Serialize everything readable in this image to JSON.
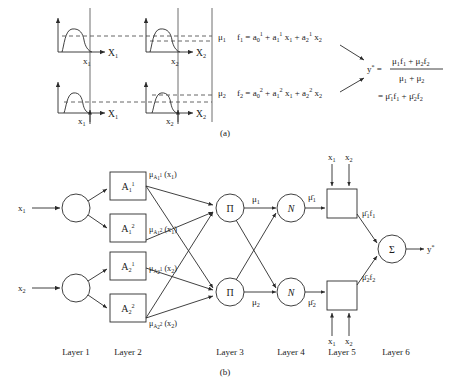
{
  "figure": {
    "caption_a": "(a)",
    "caption_b": "(b)"
  },
  "panel_a": {
    "plots": [
      {
        "id": "top-left",
        "axis_label": "X",
        "axis_sub": "1",
        "point_label": "x",
        "point_sub": "1",
        "mu_level": "high"
      },
      {
        "id": "top-right",
        "axis_label": "X",
        "axis_sub": "2",
        "point_label": "x",
        "point_sub": "2",
        "mu_level": "high"
      },
      {
        "id": "bottom-left",
        "axis_label": "X",
        "axis_sub": "1",
        "point_label": "x",
        "point_sub": "1",
        "mu_level": "low"
      },
      {
        "id": "bottom-right",
        "axis_label": "X",
        "axis_sub": "2",
        "point_label": "x",
        "point_sub": "2",
        "mu_level": "low"
      }
    ],
    "rules": [
      {
        "mu_symbol": "μ",
        "mu_sub": "1",
        "f_symbol": "f",
        "f_sub": "1",
        "equals": "=",
        "term0_base": "a",
        "term0_sub": "0",
        "term0_sup": "1",
        "plus1": "+",
        "term1_base": "a",
        "term1_sub": "1",
        "term1_sup": "1",
        "term1_var": "x",
        "term1_var_sub": "1",
        "plus2": "+",
        "term2_base": "a",
        "term2_sub": "2",
        "term2_sup": "1",
        "term2_var": "x",
        "term2_var_sub": "2"
      },
      {
        "mu_symbol": "μ",
        "mu_sub": "2",
        "f_symbol": "f",
        "f_sub": "2",
        "equals": "=",
        "term0_base": "a",
        "term0_sub": "0",
        "term0_sup": "2",
        "plus1": "+",
        "term1_base": "a",
        "term1_sub": "1",
        "term1_sup": "2",
        "term1_var": "x",
        "term1_var_sub": "1",
        "plus2": "+",
        "term2_base": "a",
        "term2_sub": "2",
        "term2_sup": "2",
        "term2_var": "x",
        "term2_var_sub": "2"
      }
    ],
    "output": {
      "y_symbol": "y",
      "y_sup": "*",
      "equals": "=",
      "numerator": {
        "m1": "μ",
        "m1s": "1",
        "f1": "f",
        "f1s": "1",
        "plus": "+",
        "m2": "μ",
        "m2s": "2",
        "f2": "f",
        "f2s": "2"
      },
      "denominator": {
        "m1": "μ",
        "m1s": "1",
        "plus": "+",
        "m2": "μ",
        "m2s": "2"
      },
      "equals2": "=",
      "second_form": {
        "m1": "μ̄",
        "m1s": "1",
        "f1": "f",
        "f1s": "1",
        "plus": "+",
        "m2": "μ̄",
        "m2s": "2",
        "f2": "f",
        "f2s": "2"
      }
    }
  },
  "panel_b": {
    "inputs": [
      {
        "label": "x",
        "sub": "1"
      },
      {
        "label": "x",
        "sub": "2"
      }
    ],
    "layer2_nodes": [
      {
        "base": "A",
        "sub": "1",
        "sup": "1",
        "out_mu": "μ",
        "out_sub": "A",
        "out_sub2": "1",
        "out_sup": "1",
        "out_arg": "(x",
        "out_arg_sub": "1",
        "out_arg_close": ")"
      },
      {
        "base": "A",
        "sub": "1",
        "sup": "2",
        "out_mu": "μ",
        "out_sub": "A",
        "out_sub2": "1",
        "out_sup": "2",
        "out_arg": "(x",
        "out_arg_sub": "1",
        "out_arg_close": ")"
      },
      {
        "base": "A",
        "sub": "2",
        "sup": "1",
        "out_mu": "μ",
        "out_sub": "A",
        "out_sub2": "2",
        "out_sup": "1",
        "out_arg": "(x",
        "out_arg_sub": "2",
        "out_arg_close": ")"
      },
      {
        "base": "A",
        "sub": "2",
        "sup": "2",
        "out_mu": "μ",
        "out_sub": "A",
        "out_sub2": "2",
        "out_sup": "2",
        "out_arg": "(x",
        "out_arg_sub": "2",
        "out_arg_close": ")"
      }
    ],
    "layer3_nodes": [
      {
        "symbol": "Π",
        "out": "μ",
        "out_sub": "1"
      },
      {
        "symbol": "Π",
        "out": "μ",
        "out_sub": "2"
      }
    ],
    "layer4_nodes": [
      {
        "symbol": "N",
        "out": "μ̄",
        "out_sub": "1"
      },
      {
        "symbol": "N",
        "out": "μ̄",
        "out_sub": "2"
      }
    ],
    "layer5_nodes": [
      {
        "inputs": [
          {
            "label": "x",
            "sub": "1"
          },
          {
            "label": "x",
            "sub": "2"
          }
        ],
        "out": "μ̄",
        "out_sub": "1",
        "out_f": "f",
        "out_f_sub": "1"
      },
      {
        "inputs": [
          {
            "label": "x",
            "sub": "1"
          },
          {
            "label": "x",
            "sub": "2"
          }
        ],
        "out": "μ̄",
        "out_sub": "2",
        "out_f": "f",
        "out_f_sub": "2"
      }
    ],
    "layer6_node": {
      "symbol": "Σ",
      "out": "y",
      "out_sup": "*"
    },
    "layer_labels": [
      "Layer 1",
      "Layer 2",
      "Layer 3",
      "Layer 4",
      "Layer 5",
      "Layer 6"
    ]
  }
}
